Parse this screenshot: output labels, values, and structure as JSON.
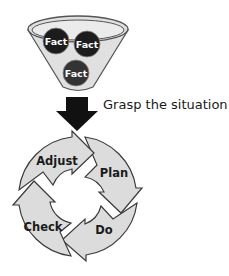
{
  "funnel": {
    "facts": [
      {
        "label": "Fact",
        "cx": 56,
        "cy": 41
      },
      {
        "label": "Fact",
        "cx": 87,
        "cy": 44
      },
      {
        "label": "Fact",
        "cx": 76,
        "cy": 73
      }
    ],
    "fill": "#e0e0e0",
    "fact_color": "#1c1c1c"
  },
  "arrow": {
    "caption": "Grasp the situation",
    "color": "#111111"
  },
  "cycle": {
    "steps": [
      {
        "label": "Plan"
      },
      {
        "label": "Do"
      },
      {
        "label": "Check"
      },
      {
        "label": "Adjust"
      }
    ],
    "fill": "#dcdcdc",
    "stroke": "#3a3a3a"
  }
}
